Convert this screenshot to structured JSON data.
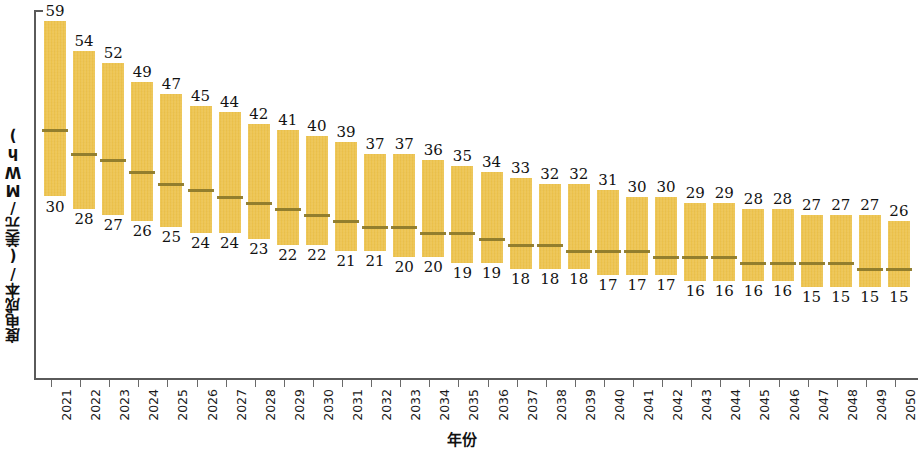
{
  "chart_data": {
    "type": "bar",
    "title": "",
    "subtitle": "",
    "xlabel": "年份",
    "ylabel": "度电成本/(美元/MWh)",
    "grid": false,
    "legend": "none",
    "ylim": [
      0,
      62
    ],
    "bar_color": "#ecc24c",
    "median_color": "#8d7a2b",
    "axis_color": "#5a5a5a",
    "note": "Floating (range) bars: each bar spans from the low value to the high value, with a horizontal median marker inside.",
    "categories": [
      "2021",
      "2022",
      "2023",
      "2024",
      "2025",
      "2026",
      "2027",
      "2028",
      "2029",
      "2030",
      "2031",
      "2032",
      "2033",
      "2034",
      "2035",
      "2036",
      "2037",
      "2038",
      "2039",
      "2040",
      "2041",
      "2042",
      "2043",
      "2044",
      "2045",
      "2046",
      "2047",
      "2048",
      "2049",
      "2050"
    ],
    "series": [
      {
        "name": "高值",
        "values": [
          59,
          54,
          52,
          49,
          47,
          45,
          44,
          42,
          41,
          40,
          39,
          37,
          37,
          36,
          35,
          34,
          33,
          32,
          32,
          31,
          30,
          30,
          29,
          29,
          28,
          28,
          27,
          27,
          27,
          26
        ]
      },
      {
        "name": "低值",
        "values": [
          30,
          28,
          27,
          26,
          25,
          24,
          24,
          23,
          22,
          22,
          21,
          21,
          20,
          20,
          19,
          19,
          18,
          18,
          18,
          17,
          17,
          17,
          16,
          16,
          16,
          16,
          15,
          15,
          15,
          15
        ]
      },
      {
        "name": "中位值",
        "values": [
          41,
          37,
          36,
          34,
          32,
          31,
          30,
          29,
          28,
          27,
          26,
          25,
          25,
          24,
          24,
          23,
          22,
          22,
          21,
          21,
          21,
          20,
          20,
          20,
          19,
          19,
          19,
          19,
          18,
          18
        ]
      }
    ]
  },
  "axes": {
    "y_title": "度电成本/(美元/MWh)",
    "x_title": "年份"
  }
}
